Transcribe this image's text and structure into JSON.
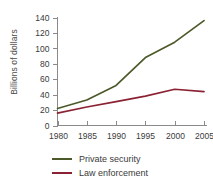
{
  "chart_data": {
    "type": "line",
    "title": "",
    "xlabel": "",
    "ylabel": "Billions of dollars",
    "x": [
      1980,
      1985,
      1990,
      1995,
      2000,
      2005
    ],
    "xtick_labels": [
      "1980",
      "1985",
      "1990",
      "1995",
      "2000",
      "2005"
    ],
    "ytick_labels": [
      "0",
      "20",
      "40",
      "60",
      "80",
      "100",
      "120",
      "140"
    ],
    "ytick_values": [
      0,
      20,
      40,
      60,
      80,
      100,
      120,
      140
    ],
    "xlim": [
      1980,
      2005
    ],
    "ylim": [
      0,
      140
    ],
    "grid": false,
    "legend_position": "bottom",
    "series": [
      {
        "name": "Private security",
        "color": "#4c5a2a",
        "values": [
          22,
          33,
          52,
          88,
          108,
          136
        ]
      },
      {
        "name": "Law enforcement",
        "color": "#8b2233",
        "values": [
          16,
          24,
          31,
          38,
          47,
          44
        ]
      }
    ]
  },
  "axis": {
    "label_y": "Billions of dollars"
  },
  "legend": {
    "items": [
      {
        "label": "Private security",
        "color": "#4c5a2a"
      },
      {
        "label": "Law enforcement",
        "color": "#8b2233"
      }
    ]
  }
}
